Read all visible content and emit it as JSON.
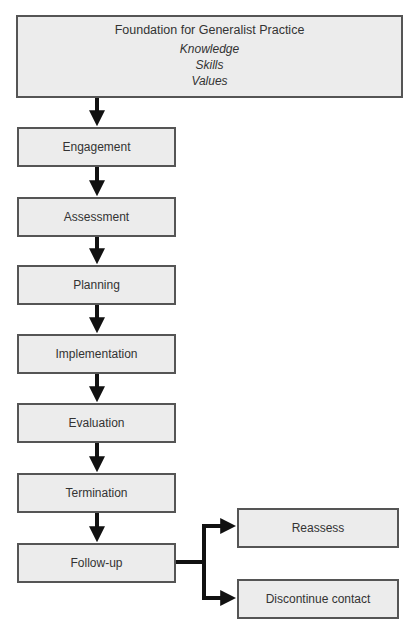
{
  "diagram": {
    "foundation": {
      "title": "Foundation for Generalist Practice",
      "items": [
        "Knowledge",
        "Skills",
        "Values"
      ]
    },
    "steps": [
      {
        "label": "Engagement"
      },
      {
        "label": "Assessment"
      },
      {
        "label": "Planning"
      },
      {
        "label": "Implementation"
      },
      {
        "label": "Evaluation"
      },
      {
        "label": "Termination"
      },
      {
        "label": "Follow-up"
      }
    ],
    "branches": [
      {
        "label": "Reassess"
      },
      {
        "label": "Discontinue contact"
      }
    ],
    "colors": {
      "box_fill": "#ececec",
      "box_border": "#555555",
      "arrow": "#111111"
    }
  }
}
